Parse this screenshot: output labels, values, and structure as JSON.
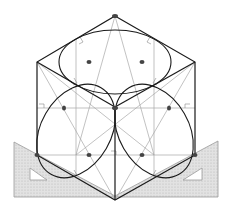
{
  "diagram": {
    "colors": {
      "outline": "#1a1a1a",
      "construction": "#a8a8a8",
      "set_square_fill": "#d9d9d9",
      "set_square_stroke": "#9a9a9a",
      "point": "#444444"
    },
    "cube": {
      "top": [
        115,
        16
      ],
      "upper_left": [
        37,
        62
      ],
      "upper_right": [
        195,
        62
      ],
      "center": [
        115,
        107
      ],
      "lower_left": [
        37,
        155
      ],
      "lower_right": [
        195,
        155
      ],
      "bottom": [
        115,
        200
      ]
    },
    "faces": [
      "top-face",
      "left-face",
      "right-face"
    ],
    "set_squares": [
      "left-set-square",
      "right-set-square"
    ]
  }
}
